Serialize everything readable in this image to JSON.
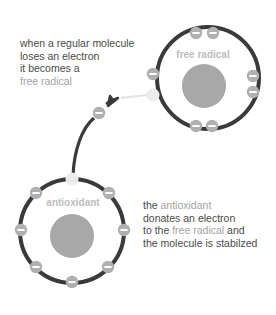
{
  "intro_text": {
    "line1": "when a regular molecule",
    "line2": "loses an electron",
    "line3": "it becomes a",
    "line4_highlight": "free radical"
  },
  "free_radical_atom": {
    "label": "free radical",
    "electron_count": 7,
    "missing_electron_slots": 1
  },
  "antioxidant_atom": {
    "label": "antioxidant",
    "electron_count": 7,
    "donated_electron_slots": 1
  },
  "outro_text": {
    "line1_prefix": "the ",
    "line1_highlight": "antioxidant",
    "line2": "donates an electron",
    "line3_prefix": "to the ",
    "line3_highlight": "free radical",
    "line3_suffix": " and",
    "line4": "the molecule is stabilzed"
  },
  "electron_symbol": "−",
  "colors": {
    "orbit": "#3a3a3a",
    "nucleus": "#a8a8a8",
    "electron": "#b0b0b0",
    "electron_sign": "#ffffff",
    "empty_slot": "#ececec",
    "text": "#4a4a4a",
    "highlight": "#a3a3a3",
    "arrow": "#3a3a3a"
  }
}
